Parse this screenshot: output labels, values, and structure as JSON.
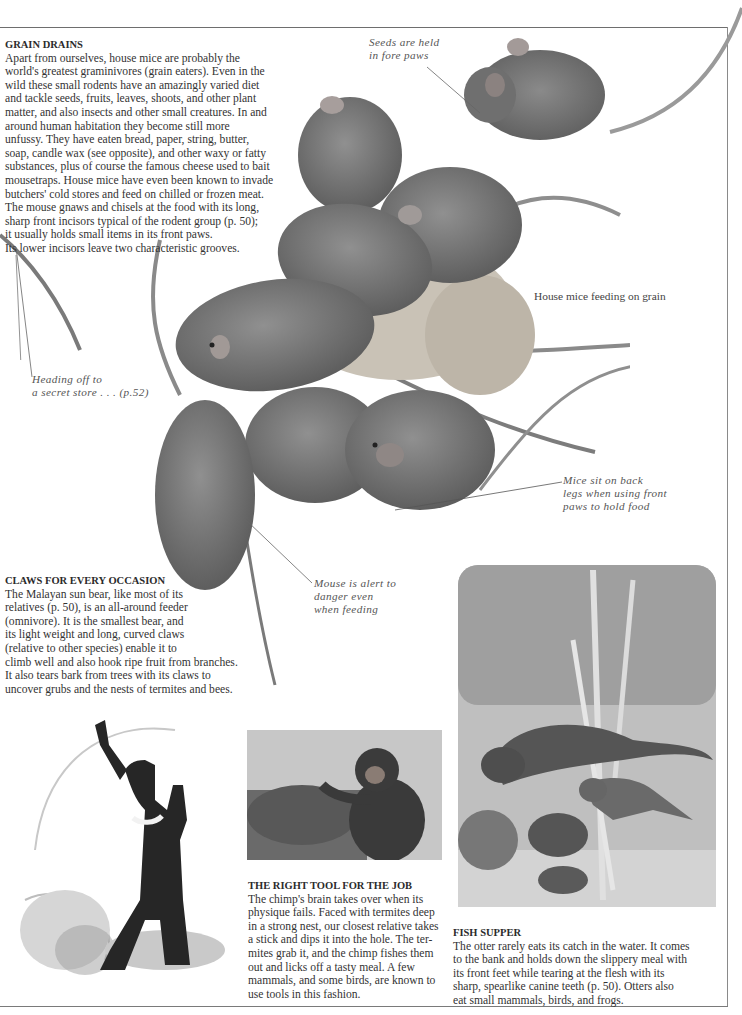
{
  "page": {
    "frame": {
      "line_color": "#6e6e6e"
    }
  },
  "grain_drains": {
    "heading": "GRAIN DRAINS",
    "lines": [
      "Apart from ourselves, house mice are probably the",
      "world's greatest graminivores (grain eaters). Even in the",
      "wild these small rodents have an amazingly varied diet",
      "and tackle seeds, fruits, leaves, shoots, and other plant",
      "matter, and also insects and other small creatures. In and",
      "around human habitation they become still more",
      "unfussy. They have eaten bread, paper, string, butter,",
      "soap, candle wax (see opposite), and other waxy or fatty",
      "substances, plus of course the famous cheese used to bait",
      "mousetraps. House mice have even been known to invade",
      "butchers' cold stores and feed on chilled or frozen meat.",
      "The mouse gnaws and chisels at the food with its long,",
      "sharp front incisors typical of the rodent group (p. 50);",
      "it usually holds small items in its front paws.",
      "Its lower incisors leave two characteristic grooves."
    ]
  },
  "callouts": {
    "seeds": [
      "Seeds are held",
      "in fore paws"
    ],
    "heading_off": [
      "Heading off to",
      "a secret store . . . (p.52)"
    ],
    "sit_back": [
      "Mice sit on back",
      "legs when using front",
      "paws to hold food"
    ],
    "alert": [
      "Mouse is alert to",
      "danger even",
      "when feeding"
    ]
  },
  "captions": {
    "mice": "House mice feeding on grain"
  },
  "claws": {
    "heading": "CLAWS FOR EVERY OCCASION",
    "lines": [
      "The Malayan sun bear, like most of its",
      "relatives (p. 50), is an all-around feeder",
      "(omnivore). It is the smallest bear, and",
      "its light weight and long, curved claws",
      "(relative to other species) enable it to",
      "climb well and also hook ripe fruit from branches.",
      "It also tears bark from trees with its claws to",
      "uncover grubs and the nests of termites and bees."
    ]
  },
  "right_tool": {
    "heading": "THE RIGHT TOOL FOR THE JOB",
    "lines": [
      "The chimp's brain takes over when its",
      "physique fails. Faced with termites deep",
      "in a strong nest, our closest relative takes",
      "a stick and dips it into the hole. The ter-",
      "mites grab it, and the chimp fishes them",
      "out and licks off a tasty meal. A few",
      "mammals, and some birds, are known to",
      "use tools in this fashion."
    ]
  },
  "fish_supper": {
    "heading": "FISH SUPPER",
    "lines": [
      "The otter rarely eats its catch in the water. It comes",
      "to the bank and holds down the slippery meal with",
      "its front feet while tearing at the flesh with its",
      "sharp, spearlike canine teeth (p. 50). Otters also",
      "eat small mammals, birds, and frogs."
    ]
  },
  "images": {
    "mice_cluster": "House mice photograph",
    "sun_bear": "Malayan sun bear engraving",
    "chimp": "Chimpanzee photograph",
    "otters": "Otters engraving"
  }
}
